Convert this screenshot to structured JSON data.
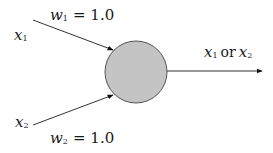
{
  "diagram": {
    "type": "neuron / perceptron",
    "inputs": [
      {
        "var": "x",
        "sub": "1",
        "weight_var": "w",
        "weight_sub": "1",
        "weight_eq": "= 1.0"
      },
      {
        "var": "x",
        "sub": "2",
        "weight_var": "w",
        "weight_sub": "2",
        "weight_eq": "= 1.0"
      }
    ],
    "output": {
      "var_a": "x",
      "sub_a": "1",
      "connector": "or",
      "var_b": "x",
      "sub_b": "2"
    },
    "colors": {
      "node_fill": "#c4c4c4",
      "node_stroke": "#555555",
      "line": "#333333",
      "background": "#ffffff"
    }
  }
}
